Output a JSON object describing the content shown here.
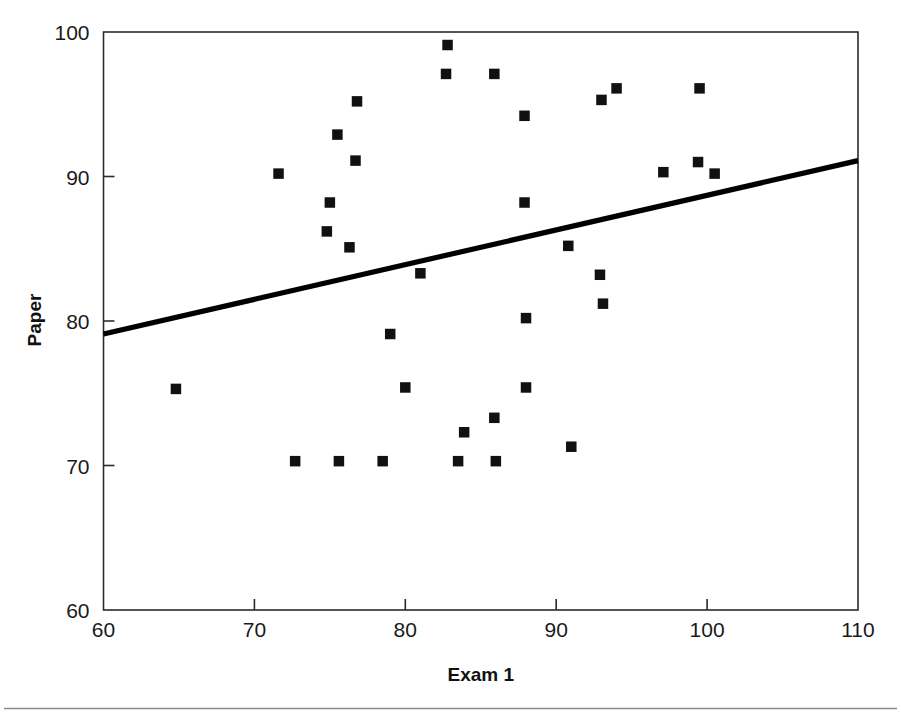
{
  "figure": {
    "background": "#ffffff",
    "line_color": "#000000",
    "marker_color": "#111111",
    "axis_color": "#2b2b2b",
    "rule_color": "#8a8a8a"
  },
  "axes": {
    "x_axis_title": "Exam 1",
    "y_axis_title": "Paper",
    "x_tick_labels": [
      "60",
      "70",
      "80",
      "90",
      "100",
      "110"
    ],
    "y_tick_labels": [
      "60",
      "70",
      "80",
      "90",
      "100"
    ]
  },
  "chart_data": {
    "type": "scatter",
    "title": "",
    "xlabel": "Exam 1",
    "ylabel": "Paper",
    "xlim": [
      60,
      110
    ],
    "ylim": [
      60,
      100
    ],
    "xticks": [
      60,
      70,
      80,
      90,
      100,
      110
    ],
    "yticks": [
      60,
      70,
      80,
      90,
      100
    ],
    "grid": false,
    "legend": "none",
    "marker_style": "filled-square",
    "points": [
      {
        "x": 64.8,
        "y": 75.3
      },
      {
        "x": 71.6,
        "y": 90.2
      },
      {
        "x": 72.7,
        "y": 70.3
      },
      {
        "x": 74.8,
        "y": 86.2
      },
      {
        "x": 75.0,
        "y": 88.2
      },
      {
        "x": 75.5,
        "y": 92.9
      },
      {
        "x": 75.6,
        "y": 70.3
      },
      {
        "x": 76.3,
        "y": 85.1
      },
      {
        "x": 76.8,
        "y": 95.2
      },
      {
        "x": 76.7,
        "y": 91.1
      },
      {
        "x": 78.5,
        "y": 70.3
      },
      {
        "x": 79.0,
        "y": 79.1
      },
      {
        "x": 80.0,
        "y": 75.4
      },
      {
        "x": 81.0,
        "y": 83.3
      },
      {
        "x": 82.8,
        "y": 99.1
      },
      {
        "x": 82.7,
        "y": 97.1
      },
      {
        "x": 83.5,
        "y": 70.3
      },
      {
        "x": 83.9,
        "y": 72.3
      },
      {
        "x": 85.9,
        "y": 97.1
      },
      {
        "x": 86.0,
        "y": 70.3
      },
      {
        "x": 85.9,
        "y": 73.3
      },
      {
        "x": 87.9,
        "y": 94.2
      },
      {
        "x": 87.9,
        "y": 88.2
      },
      {
        "x": 88.0,
        "y": 80.2
      },
      {
        "x": 88.0,
        "y": 75.4
      },
      {
        "x": 90.8,
        "y": 85.2
      },
      {
        "x": 91.0,
        "y": 71.3
      },
      {
        "x": 92.9,
        "y": 83.2
      },
      {
        "x": 93.0,
        "y": 95.3
      },
      {
        "x": 93.1,
        "y": 81.2
      },
      {
        "x": 94.0,
        "y": 96.1
      },
      {
        "x": 97.1,
        "y": 90.3
      },
      {
        "x": 99.4,
        "y": 91.0
      },
      {
        "x": 99.5,
        "y": 96.1
      },
      {
        "x": 100.5,
        "y": 90.2
      }
    ],
    "trend_line": {
      "type": "linear-fit",
      "x_start": 60,
      "y_start": 79.1,
      "x_end": 110,
      "y_end": 91.1
    }
  }
}
